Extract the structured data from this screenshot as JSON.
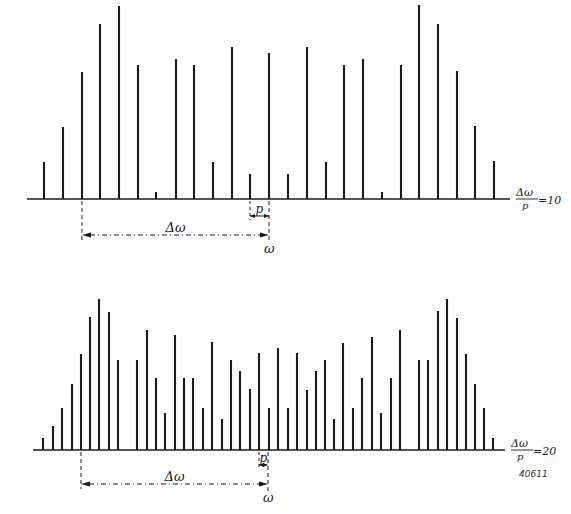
{
  "figure": {
    "code": "40611",
    "ink_color": "#1a1a1a",
    "background": "#ffffff"
  },
  "chart_data": [
    {
      "type": "bar",
      "name": "spectrum-ratio-10",
      "description": "Line spectrum (stick diagram) with spacing p; Δω/p = 10",
      "ratio_label": {
        "numerator": "Δω",
        "denominator": "p",
        "value": "=10"
      },
      "annotations": {
        "delta_label": "Δω",
        "spacing_label": "p",
        "omega_label": "ω"
      },
      "baseline_y": 199,
      "axis": {
        "x_start": 27,
        "x_end": 510
      },
      "delta_span": {
        "x_from": 82,
        "x_to": 269,
        "y": 235
      },
      "p_span": {
        "x_from": 250,
        "x_to": 269,
        "y": 216
      },
      "x": [
        44,
        63,
        82,
        100,
        119,
        138,
        156,
        176,
        194,
        213,
        232,
        250,
        269,
        288,
        307,
        326,
        344,
        363,
        382,
        401,
        419,
        438,
        457,
        475,
        494
      ],
      "values_px": [
        37,
        72,
        127,
        175,
        193,
        134,
        7,
        140,
        134,
        37,
        152,
        25,
        146,
        25,
        152,
        37,
        134,
        140,
        7,
        134,
        194,
        175,
        128,
        73,
        38
      ],
      "xlabel": "ω",
      "ylabel": "",
      "grid": false
    },
    {
      "type": "bar",
      "name": "spectrum-ratio-20",
      "description": "Line spectrum (stick diagram) with spacing p; Δω/p = 20",
      "ratio_label": {
        "numerator": "Δω",
        "denominator": "p",
        "value": "=20"
      },
      "annotations": {
        "delta_label": "Δω",
        "spacing_label": "p",
        "omega_label": "ω"
      },
      "baseline_y": 450,
      "axis": {
        "x_start": 33,
        "x_end": 505
      },
      "delta_span": {
        "x_from": 81,
        "x_to": 268,
        "y": 484
      },
      "p_span": {
        "x_from": 259,
        "x_to": 268,
        "y": 465
      },
      "x": [
        43,
        53,
        62,
        72,
        81,
        90,
        99,
        109,
        118,
        137,
        147,
        156,
        165,
        175,
        184,
        193,
        203,
        212,
        222,
        231,
        240,
        250,
        259,
        269,
        278,
        288,
        297,
        307,
        316,
        325,
        334,
        343,
        353,
        362,
        372,
        381,
        391,
        400,
        419,
        428,
        438,
        447,
        457,
        466,
        475,
        484,
        493
      ],
      "values_px": [
        12,
        24,
        42,
        66,
        96,
        133,
        151,
        138,
        90,
        90,
        120,
        72,
        37,
        115,
        72,
        72,
        42,
        108,
        31,
        90,
        79,
        61,
        97,
        42,
        102,
        42,
        97,
        60,
        79,
        90,
        31,
        107,
        42,
        72,
        113,
        37,
        72,
        120,
        90,
        90,
        139,
        151,
        132,
        96,
        66,
        42,
        12
      ],
      "xlabel": "ω",
      "ylabel": "",
      "grid": false
    }
  ]
}
